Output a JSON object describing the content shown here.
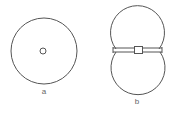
{
  "figure": {
    "panels": [
      {
        "id": "a",
        "label": "a",
        "shapes": {
          "outer_circle": {
            "cx": 44,
            "cy": 51,
            "r": 33
          },
          "inner_circle": {
            "cx": 43,
            "cy": 51,
            "r": 3
          }
        },
        "label_pos": {
          "x": 44,
          "y": 94
        }
      },
      {
        "id": "b",
        "label": "b",
        "shapes": {
          "top_circle": {
            "cx": 137,
            "cy": 32,
            "r": 27
          },
          "bottom_circle": {
            "cx": 138,
            "cy": 68,
            "r": 27
          },
          "band": {
            "x": 114,
            "y": 48,
            "width": 48,
            "height": 4
          },
          "square": {
            "x": 135,
            "y": 46,
            "width": 8,
            "height": 8
          }
        },
        "label_pos": {
          "x": 137,
          "y": 104
        }
      }
    ],
    "colors": {
      "stroke": "#555555",
      "label": "#666666",
      "background": "#ffffff"
    }
  }
}
